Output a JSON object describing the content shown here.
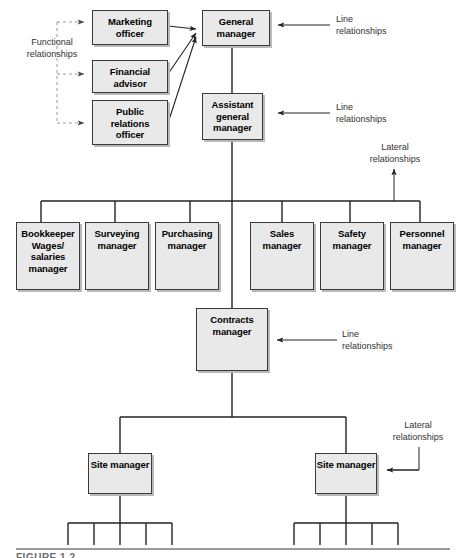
{
  "figure": {
    "type": "organizational-chart",
    "caption": "FIGURE 1.2"
  },
  "nodes": {
    "marketing_officer": "Marketing\nofficer",
    "financial_advisor": "Financial\nadvisor",
    "public_relations_officer": "Public\nrelations\nofficer",
    "general_manager": "General\nmanager",
    "assistant_general_manager": "Assistant\ngeneral\nmanager",
    "bookkeeper": "Bookkeeper\nWages/\nsalaries\nmanager",
    "surveying_manager": "Surveying\nmanager",
    "purchasing_manager": "Purchasing\nmanager",
    "sales_manager": "Sales\nmanager",
    "safety_manager": "Safety\nmanager",
    "personnel_manager": "Personnel\nmanager",
    "contracts_manager": "Contracts\nmanager",
    "site_manager_left": "Site manager",
    "site_manager_right": "Site manager"
  },
  "annotations": {
    "functional_relationships": "Functional\nrelationships",
    "line_relationships_general": "Line\nrelationships",
    "line_relationships_assistant": "Line\nrelationships",
    "lateral_relationships_top": "Lateral\nrelationships",
    "line_relationships_contracts": "Line\nrelationships",
    "lateral_relationships_bottom": "Lateral\nrelationships"
  },
  "chart_data": {
    "type": "diagram",
    "levels": [
      {
        "level": 1,
        "members": [
          "General manager"
        ]
      },
      {
        "level": 2,
        "members": [
          "Assistant general manager"
        ]
      },
      {
        "level": 3,
        "members": [
          "Bookkeeper Wages/salaries manager",
          "Surveying manager",
          "Purchasing manager",
          "Sales manager",
          "Safety manager",
          "Personnel manager"
        ]
      },
      {
        "level": 4,
        "members": [
          "Contracts manager"
        ]
      },
      {
        "level": 5,
        "members": [
          "Site manager",
          "Site manager"
        ]
      }
    ],
    "staff_advisors": [
      "Marketing officer",
      "Financial advisor",
      "Public relations officer"
    ],
    "relationship_types": [
      "Line relationships",
      "Functional relationships",
      "Lateral relationships"
    ],
    "legend_position": "right"
  },
  "colors": {
    "box_fill": "#e9e9e9",
    "box_border": "#3a3a3a",
    "box_shadow": "#b9b9b9",
    "line": "#222222",
    "dashed_line": "#9a9a9a",
    "text": "#000000",
    "annotation_text": "#333333"
  }
}
